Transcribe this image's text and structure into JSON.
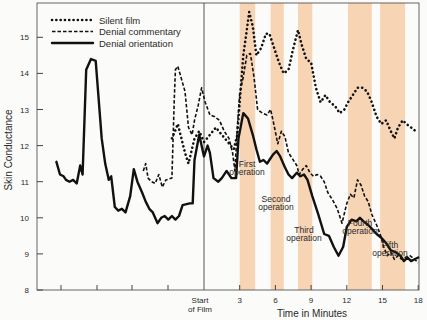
{
  "chart_data": {
    "type": "line",
    "title": "",
    "xlabel": "Time in Minutes",
    "ylabel": "Skin Conductance",
    "ylim": [
      8,
      16
    ],
    "y_ticks": [
      "8",
      "9",
      "10",
      "11",
      "12",
      "13",
      "14",
      "15"
    ],
    "x_ticks": [
      {
        "label": "Start",
        "label2": "of Film",
        "min": 0
      },
      {
        "label": "3",
        "min": 3
      },
      {
        "label": "6",
        "min": 6
      },
      {
        "label": "9",
        "min": 9
      },
      {
        "label": "12",
        "min": 12
      },
      {
        "label": "15",
        "min": 15
      },
      {
        "label": "18",
        "min": 18
      }
    ],
    "grid": false,
    "legend": {
      "position": "top-left",
      "entries": [
        {
          "name": "Silent film",
          "style": "dotted"
        },
        {
          "name": "Denial commentary",
          "style": "dashed"
        },
        {
          "name": "Denial orientation",
          "style": "solid"
        }
      ]
    },
    "shaded_regions": [
      {
        "label": "First",
        "label2": "operation",
        "start_min": 3.0,
        "end_min": 4.3
      },
      {
        "label": "Second",
        "label2": "operation",
        "start_min": 5.6,
        "end_min": 6.7
      },
      {
        "label": "Third",
        "label2": "operation",
        "start_min": 7.9,
        "end_min": 9.1
      },
      {
        "label": "Fourth",
        "label2": "operation",
        "start_min": 12.1,
        "end_min": 14.1
      },
      {
        "label": "Fifth",
        "label2": "operation",
        "start_min": 14.8,
        "end_min": 16.9
      }
    ],
    "band_color": "#f6cda8",
    "series": [
      {
        "name": "Denial orientation",
        "style": "solid",
        "points": [
          [
            -12.4,
            11.55
          ],
          [
            -12.1,
            11.2
          ],
          [
            -11.8,
            11.15
          ],
          [
            -11.6,
            11.05
          ],
          [
            -11.3,
            11.0
          ],
          [
            -11.0,
            11.05
          ],
          [
            -10.7,
            10.95
          ],
          [
            -10.4,
            11.45
          ],
          [
            -10.2,
            11.2
          ],
          [
            -9.9,
            14.1
          ],
          [
            -9.5,
            14.4
          ],
          [
            -9.1,
            14.35
          ],
          [
            -8.6,
            12.2
          ],
          [
            -8.3,
            11.5
          ],
          [
            -8.0,
            11.05
          ],
          [
            -7.8,
            11.15
          ],
          [
            -7.5,
            10.3
          ],
          [
            -7.2,
            10.2
          ],
          [
            -6.9,
            10.25
          ],
          [
            -6.6,
            10.15
          ],
          [
            -6.2,
            10.6
          ],
          [
            -5.9,
            11.35
          ],
          [
            -5.6,
            11.0
          ],
          [
            -5.2,
            10.7
          ],
          [
            -4.9,
            10.45
          ],
          [
            -4.6,
            10.25
          ],
          [
            -4.3,
            10.15
          ],
          [
            -3.9,
            9.85
          ],
          [
            -3.6,
            10.0
          ],
          [
            -3.3,
            10.05
          ],
          [
            -3.0,
            9.95
          ],
          [
            -2.7,
            10.05
          ],
          [
            -2.4,
            9.95
          ],
          [
            -2.1,
            10.05
          ],
          [
            -1.8,
            10.35
          ],
          [
            -1.2,
            10.4
          ],
          [
            -0.95,
            10.4
          ],
          [
            -0.8,
            11.6
          ],
          [
            -0.4,
            12.3
          ],
          [
            0.0,
            11.7
          ],
          [
            0.3,
            12.0
          ],
          [
            0.5,
            11.8
          ],
          [
            0.8,
            11.1
          ],
          [
            1.2,
            11.0
          ],
          [
            1.5,
            11.1
          ],
          [
            1.9,
            11.3
          ],
          [
            2.3,
            11.1
          ],
          [
            2.7,
            11.1
          ],
          [
            2.9,
            12.2
          ],
          [
            3.3,
            12.9
          ],
          [
            3.7,
            12.75
          ],
          [
            4.1,
            12.3
          ],
          [
            4.4,
            11.9
          ],
          [
            4.7,
            11.55
          ],
          [
            5.0,
            11.6
          ],
          [
            5.3,
            11.5
          ],
          [
            5.5,
            11.6
          ],
          [
            5.8,
            11.75
          ],
          [
            6.1,
            11.85
          ],
          [
            6.4,
            11.7
          ],
          [
            6.8,
            11.4
          ],
          [
            7.1,
            11.2
          ],
          [
            7.4,
            11.1
          ],
          [
            7.8,
            11.25
          ],
          [
            8.1,
            11.15
          ],
          [
            8.4,
            11.2
          ],
          [
            8.7,
            11.05
          ],
          [
            9.1,
            10.6
          ],
          [
            9.6,
            10.1
          ],
          [
            10.1,
            9.55
          ],
          [
            10.5,
            9.5
          ],
          [
            10.9,
            9.2
          ],
          [
            11.3,
            8.95
          ],
          [
            11.7,
            9.2
          ],
          [
            12.0,
            9.75
          ],
          [
            12.4,
            9.95
          ],
          [
            12.8,
            9.9
          ],
          [
            13.1,
            10.0
          ],
          [
            13.4,
            9.9
          ],
          [
            13.8,
            9.8
          ],
          [
            14.1,
            9.7
          ],
          [
            14.5,
            9.55
          ],
          [
            14.9,
            9.45
          ],
          [
            15.3,
            9.3
          ],
          [
            15.7,
            9.1
          ],
          [
            16.1,
            9.05
          ],
          [
            16.5,
            8.95
          ],
          [
            16.8,
            8.8
          ],
          [
            17.1,
            8.9
          ],
          [
            17.4,
            8.8
          ],
          [
            17.7,
            8.85
          ],
          [
            18.0,
            8.9
          ]
        ]
      },
      {
        "name": "Denial commentary",
        "style": "dashed",
        "points": [
          [
            -5.1,
            11.3
          ],
          [
            -4.9,
            11.5
          ],
          [
            -4.7,
            11.1
          ],
          [
            -4.4,
            11.0
          ],
          [
            -4.1,
            10.95
          ],
          [
            -3.8,
            11.2
          ],
          [
            -3.5,
            10.85
          ],
          [
            -3.2,
            11.05
          ],
          [
            -2.7,
            11.1
          ],
          [
            -2.5,
            13.3
          ],
          [
            -2.4,
            14.1
          ],
          [
            -2.2,
            14.2
          ],
          [
            -1.9,
            13.85
          ],
          [
            -1.6,
            13.5
          ],
          [
            -1.3,
            12.5
          ],
          [
            -1.0,
            12.3
          ],
          [
            -0.8,
            12.7
          ],
          [
            -0.5,
            13.1
          ],
          [
            -0.2,
            13.6
          ],
          [
            0.1,
            13.2
          ],
          [
            0.5,
            12.85
          ],
          [
            0.9,
            12.8
          ],
          [
            1.3,
            12.7
          ],
          [
            1.7,
            12.4
          ],
          [
            2.1,
            12.2
          ],
          [
            2.4,
            11.8
          ],
          [
            2.6,
            11.3
          ],
          [
            2.8,
            12.5
          ],
          [
            3.0,
            13.45
          ],
          [
            3.3,
            13.9
          ],
          [
            3.6,
            14.5
          ],
          [
            3.9,
            14.55
          ],
          [
            4.2,
            13.9
          ],
          [
            4.5,
            13.0
          ],
          [
            4.9,
            12.9
          ],
          [
            5.3,
            12.85
          ],
          [
            5.6,
            13.0
          ],
          [
            5.8,
            12.7
          ],
          [
            6.2,
            12.05
          ],
          [
            6.5,
            12.4
          ],
          [
            6.8,
            12.25
          ],
          [
            7.1,
            11.8
          ],
          [
            7.4,
            11.65
          ],
          [
            7.8,
            11.45
          ],
          [
            8.0,
            11.2
          ],
          [
            8.3,
            11.35
          ],
          [
            8.6,
            11.45
          ],
          [
            8.9,
            11.25
          ],
          [
            9.2,
            11.15
          ],
          [
            9.5,
            11.2
          ],
          [
            9.8,
            11.15
          ],
          [
            10.1,
            11.0
          ],
          [
            10.4,
            10.7
          ],
          [
            10.8,
            10.5
          ],
          [
            11.2,
            10.25
          ],
          [
            11.6,
            9.85
          ],
          [
            12.0,
            10.4
          ],
          [
            12.3,
            10.65
          ],
          [
            12.6,
            10.55
          ],
          [
            12.9,
            11.05
          ],
          [
            13.2,
            10.9
          ],
          [
            13.5,
            10.6
          ],
          [
            13.8,
            10.45
          ],
          [
            14.1,
            10.1
          ],
          [
            14.5,
            9.8
          ],
          [
            14.8,
            9.55
          ],
          [
            15.1,
            9.2
          ],
          [
            15.4,
            8.95
          ],
          [
            15.7,
            9.05
          ],
          [
            16.0,
            8.85
          ],
          [
            16.3,
            8.95
          ],
          [
            16.6,
            8.85
          ],
          [
            16.9,
            8.9
          ],
          [
            17.3,
            8.95
          ],
          [
            17.7,
            8.85
          ],
          [
            18.0,
            8.75
          ]
        ]
      },
      {
        "name": "Silent film",
        "style": "dotted",
        "points": [
          [
            -2.7,
            12.2
          ],
          [
            -2.5,
            12.35
          ],
          [
            -2.2,
            12.6
          ],
          [
            -1.9,
            12.2
          ],
          [
            -1.6,
            11.8
          ],
          [
            -1.3,
            11.5
          ],
          [
            -0.8,
            12.2
          ],
          [
            -0.4,
            12.4
          ],
          [
            0.0,
            12.1
          ],
          [
            0.5,
            12.3
          ],
          [
            1.0,
            12.5
          ],
          [
            1.5,
            12.3
          ],
          [
            2.0,
            12.1
          ],
          [
            2.5,
            11.9
          ],
          [
            2.8,
            12.3
          ],
          [
            3.0,
            13.2
          ],
          [
            3.3,
            14.5
          ],
          [
            3.6,
            15.2
          ],
          [
            3.8,
            15.7
          ],
          [
            4.1,
            15.3
          ],
          [
            4.4,
            14.5
          ],
          [
            4.8,
            14.7
          ],
          [
            5.2,
            15.1
          ],
          [
            5.5,
            15.1
          ],
          [
            5.9,
            14.7
          ],
          [
            6.3,
            14.3
          ],
          [
            6.7,
            14.0
          ],
          [
            7.1,
            14.1
          ],
          [
            7.5,
            14.7
          ],
          [
            7.9,
            15.2
          ],
          [
            8.2,
            14.8
          ],
          [
            8.6,
            14.4
          ],
          [
            9.0,
            14.3
          ],
          [
            9.4,
            13.6
          ],
          [
            9.8,
            13.2
          ],
          [
            10.2,
            13.4
          ],
          [
            10.6,
            13.2
          ],
          [
            11.0,
            13.1
          ],
          [
            11.4,
            12.9
          ],
          [
            11.8,
            13.0
          ],
          [
            12.1,
            13.2
          ],
          [
            12.5,
            13.4
          ],
          [
            12.9,
            13.6
          ],
          [
            13.3,
            13.6
          ],
          [
            13.7,
            13.5
          ],
          [
            14.1,
            13.2
          ],
          [
            14.5,
            12.8
          ],
          [
            14.9,
            12.6
          ],
          [
            15.3,
            12.7
          ],
          [
            15.7,
            12.4
          ],
          [
            16.0,
            12.2
          ],
          [
            16.3,
            12.5
          ],
          [
            16.7,
            12.7
          ],
          [
            17.0,
            12.6
          ],
          [
            17.4,
            12.5
          ],
          [
            17.8,
            12.4
          ]
        ]
      }
    ]
  }
}
